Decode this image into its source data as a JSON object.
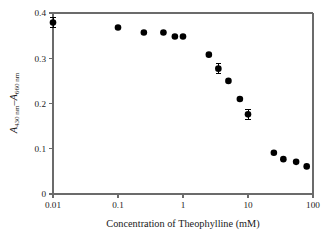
{
  "chart_data": {
    "type": "scatter",
    "title": "",
    "xlabel": "Concentration of Theophylline (mM)",
    "ylabel": "A430 nm − A660 nm",
    "ylabel_parts": {
      "a1": "A",
      "sub1": "430 nm",
      "minus": "–",
      "a2": "A",
      "sub2": "660 nm"
    },
    "xscale": "log",
    "yscale": "linear",
    "xlim": [
      0.01,
      100
    ],
    "ylim": [
      0,
      0.4
    ],
    "grid": false,
    "legend": "none",
    "xticks": [
      "0.01",
      "0.1",
      "1",
      "10",
      "100"
    ],
    "xtick_values": [
      0.01,
      0.1,
      1,
      10,
      100
    ],
    "yticks": [
      "0",
      "0.1",
      "0.2",
      "0.3",
      "0.4"
    ],
    "ytick_values": [
      0,
      0.1,
      0.2,
      0.3,
      0.4
    ],
    "marker": "filled-circle",
    "marker_color": "#000000",
    "axis_color": "#6b6b6b",
    "x": [
      0.01,
      0.1,
      0.25,
      0.5,
      0.75,
      1.0,
      2.5,
      3.5,
      5.0,
      7.5,
      10.0,
      25.0,
      35.0,
      55.0,
      80.0
    ],
    "y": [
      0.379,
      0.368,
      0.357,
      0.357,
      0.348,
      0.348,
      0.308,
      0.277,
      0.25,
      0.21,
      0.176,
      0.091,
      0.077,
      0.071,
      0.061
    ],
    "yerr": [
      0.011,
      0.0,
      0.0,
      0.0,
      0.0,
      0.0,
      0.0,
      0.011,
      0.0,
      0.0,
      0.011,
      0.0,
      0.0,
      0.0,
      0.0
    ],
    "points": [
      {
        "x": 0.01,
        "y": 0.379,
        "yerr": 0.011
      },
      {
        "x": 0.1,
        "y": 0.368,
        "yerr": 0.0
      },
      {
        "x": 0.25,
        "y": 0.357,
        "yerr": 0.0
      },
      {
        "x": 0.5,
        "y": 0.357,
        "yerr": 0.0
      },
      {
        "x": 0.75,
        "y": 0.348,
        "yerr": 0.0
      },
      {
        "x": 1.0,
        "y": 0.348,
        "yerr": 0.0
      },
      {
        "x": 2.5,
        "y": 0.308,
        "yerr": 0.0
      },
      {
        "x": 3.5,
        "y": 0.277,
        "yerr": 0.011
      },
      {
        "x": 5.0,
        "y": 0.25,
        "yerr": 0.0
      },
      {
        "x": 7.5,
        "y": 0.21,
        "yerr": 0.0
      },
      {
        "x": 10.0,
        "y": 0.176,
        "yerr": 0.011
      },
      {
        "x": 25.0,
        "y": 0.091,
        "yerr": 0.0
      },
      {
        "x": 35.0,
        "y": 0.077,
        "yerr": 0.0
      },
      {
        "x": 55.0,
        "y": 0.071,
        "yerr": 0.0
      },
      {
        "x": 80.0,
        "y": 0.061,
        "yerr": 0.0
      }
    ]
  }
}
